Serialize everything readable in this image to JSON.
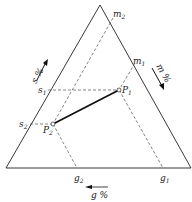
{
  "diagram": {
    "type": "ternary",
    "axes": {
      "s": {
        "label": "s %",
        "direction": "up-left side"
      },
      "m": {
        "label": "m %",
        "direction": "down-right side"
      },
      "g": {
        "label": "g %",
        "direction": "left along base"
      }
    },
    "points": [
      {
        "name": "P",
        "sub": "1"
      },
      {
        "name": "P",
        "sub": "2"
      }
    ],
    "ticks": {
      "m2": {
        "name": "m",
        "sub": "2"
      },
      "m1": {
        "name": "m",
        "sub": "1"
      },
      "s1": {
        "name": "s",
        "sub": "1"
      },
      "s2": {
        "name": "s",
        "sub": "2"
      },
      "g2": {
        "name": "g",
        "sub": "2"
      },
      "g1": {
        "name": "g",
        "sub": "1"
      }
    },
    "colors": {
      "line": "#222222",
      "background": "#ffffff"
    }
  }
}
